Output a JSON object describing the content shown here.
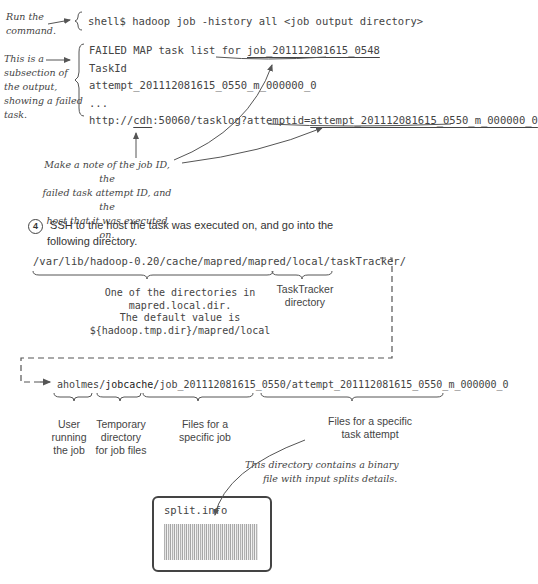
{
  "annotations": {
    "run_command": [
      "Run the",
      "command."
    ],
    "subsection": [
      "This is a",
      "subsection of",
      "the output,",
      "showing a failed",
      "task."
    ],
    "make_note": [
      "Make a note of the job ID, the",
      "failed task attempt ID, and the",
      "host that it was executed on."
    ],
    "binary_file": [
      "This directory contains a binary",
      "file with input splits details."
    ]
  },
  "command": {
    "prompt": "shell$",
    "text": "hadoop job -history all <job output directory>"
  },
  "output": {
    "line1_prefix": "FAILED MAP task list for ",
    "job_id": "job_201112081615_0548",
    "line2": "TaskId",
    "line3": "attempt_201112081615_0550_m_000000_0",
    "line4": "...",
    "line5_prefix": "http://",
    "host": "cdh",
    "line5_mid": ":50060/tasklog?attemptid=",
    "attempt_id": "attempt_201112081615_0550_m_000000_0"
  },
  "step4": {
    "number": "4",
    "text_line1": "SSH to the host the task was executed on, and go into the",
    "text_line2": "following directory."
  },
  "path1": {
    "local_dir": "/var/lib/hadoop-0.20/cache/mapred/mapred/local/",
    "tasktracker": "taskTracker/"
  },
  "path1_labels": {
    "local_dir_desc": [
      "One of the directories in",
      "mapred.local.dir.",
      "The default value is",
      "${hadoop.tmp.dir}/mapred/local"
    ],
    "tasktracker_desc": [
      "TaskTracker",
      "directory"
    ]
  },
  "path2": {
    "user": "aholmes",
    "sep1": "/",
    "jobcache": "jobcache/",
    "job": "job_201112081615_0550",
    "sep2": "/",
    "attempt": "attempt_201112081615_0550_m_000000_0"
  },
  "path2_labels": {
    "user": [
      "User",
      "running",
      "the job"
    ],
    "jobcache": [
      "Temporary",
      "directory",
      "for job files"
    ],
    "job": [
      "Files for a",
      "specific job"
    ],
    "attempt": [
      "Files for a specific",
      "task attempt"
    ]
  },
  "split_file": {
    "name": "split.info"
  }
}
